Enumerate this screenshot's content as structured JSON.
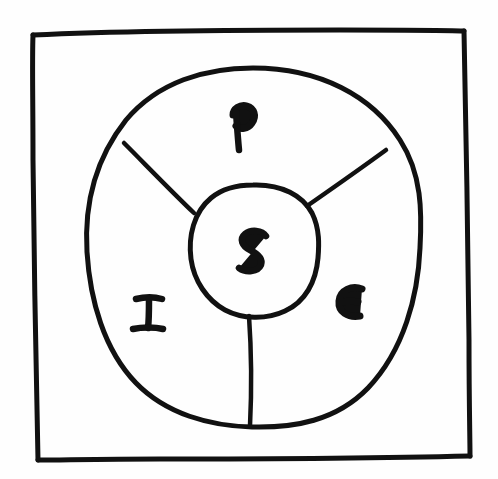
{
  "diagram": {
    "style": "hand-drawn sketch",
    "background_color": "#fefefe",
    "ink_color": "#111111",
    "frame": {
      "name": "outer-frame",
      "shape": "rectangle",
      "stroke_width": 5
    },
    "outer_circle": {
      "name": "outer-circle",
      "shape": "ellipse",
      "center": [
        253,
        247
      ],
      "rx": 167,
      "ry": 180,
      "stroke_width": 5
    },
    "inner_circle": {
      "name": "inner-circle",
      "shape": "ellipse",
      "center": [
        253,
        250
      ],
      "rx": 64,
      "ry": 66,
      "stroke_width": 5
    },
    "spokes": [
      {
        "name": "spoke-upper-left",
        "from": [
          124,
          143
        ],
        "to": [
          194,
          212
        ]
      },
      {
        "name": "spoke-upper-right",
        "from": [
          386,
          150
        ],
        "to": [
          306,
          205
        ]
      },
      {
        "name": "spoke-bottom",
        "from": [
          250,
          316
        ],
        "to": [
          250,
          425
        ]
      }
    ],
    "labels": {
      "center": {
        "text": "S",
        "position": [
          253,
          250
        ],
        "region": "core"
      },
      "top": {
        "text": "P",
        "position": [
          239,
          127
        ],
        "region": "upper-sector"
      },
      "left": {
        "text": "I",
        "position": [
          148,
          312
        ],
        "region": "lower-left-sector"
      },
      "right": {
        "text": "E",
        "position": [
          349,
          303
        ],
        "region": "lower-right-sector"
      }
    },
    "sectors": [
      {
        "name": "sector-p",
        "label": "P"
      },
      {
        "name": "sector-i",
        "label": "I"
      },
      {
        "name": "sector-e",
        "label": "E"
      }
    ]
  }
}
